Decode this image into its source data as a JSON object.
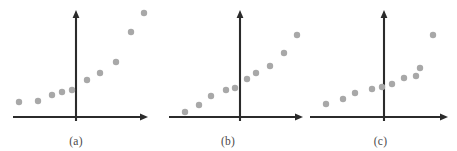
{
  "figure": {
    "width": 457,
    "height": 151,
    "background": "#ffffff",
    "dot_color": "#a8a8a8",
    "axis_color": "#2b2b2b",
    "caption_color": "#4a4a4a",
    "dot_radius": 3.2
  },
  "chart_data": [
    {
      "type": "scatter",
      "title": "",
      "caption": "(a)",
      "xlabel": "",
      "ylabel": "",
      "grid": false,
      "legend": "none",
      "axes": {
        "x_axis_y": 117,
        "x_axis_x_start": 13,
        "x_axis_x_end": 148,
        "y_axis_x": 76,
        "y_axis_y_top": 10,
        "y_axis_y_bottom": 121,
        "origin_x": 76,
        "origin_y": 117,
        "xlim": [
          13,
          148
        ],
        "ylim": [
          10,
          121
        ]
      },
      "panel_origin_x": 0,
      "panel_width": 152,
      "points": [
        {
          "x": 19,
          "y": 102
        },
        {
          "x": 38,
          "y": 101
        },
        {
          "x": 52,
          "y": 95
        },
        {
          "x": 62,
          "y": 92
        },
        {
          "x": 72,
          "y": 90
        },
        {
          "x": 87,
          "y": 80
        },
        {
          "x": 100,
          "y": 73
        },
        {
          "x": 116,
          "y": 62
        },
        {
          "x": 131,
          "y": 32
        },
        {
          "x": 144,
          "y": 13
        }
      ]
    },
    {
      "type": "scatter",
      "title": "",
      "caption": "(b)",
      "xlabel": "",
      "ylabel": "",
      "grid": false,
      "legend": "none",
      "axes": {
        "x_axis_y": 117,
        "x_axis_x_start": 169,
        "x_axis_x_end": 303,
        "y_axis_x": 240,
        "y_axis_y_top": 10,
        "y_axis_y_bottom": 121,
        "origin_x": 240,
        "origin_y": 117,
        "xlim": [
          169,
          303
        ],
        "ylim": [
          10,
          121
        ]
      },
      "panel_origin_x": 152,
      "panel_width": 152,
      "points": [
        {
          "x": 185,
          "y": 112
        },
        {
          "x": 199,
          "y": 105
        },
        {
          "x": 211,
          "y": 96
        },
        {
          "x": 226,
          "y": 90
        },
        {
          "x": 235,
          "y": 88
        },
        {
          "x": 247,
          "y": 79
        },
        {
          "x": 256,
          "y": 73
        },
        {
          "x": 270,
          "y": 66
        },
        {
          "x": 284,
          "y": 53
        },
        {
          "x": 297,
          "y": 35
        }
      ]
    },
    {
      "type": "scatter",
      "title": "",
      "caption": "(c)",
      "xlabel": "",
      "ylabel": "",
      "grid": false,
      "legend": "none",
      "axes": {
        "x_axis_y": 117,
        "x_axis_x_start": 310,
        "x_axis_x_end": 448,
        "y_axis_x": 384,
        "y_axis_y_top": 10,
        "y_axis_y_bottom": 121,
        "origin_x": 384,
        "origin_y": 117,
        "xlim": [
          310,
          448
        ],
        "ylim": [
          10,
          121
        ]
      },
      "panel_origin_x": 304,
      "panel_width": 153,
      "points": [
        {
          "x": 326,
          "y": 104
        },
        {
          "x": 343,
          "y": 99
        },
        {
          "x": 355,
          "y": 93
        },
        {
          "x": 372,
          "y": 89
        },
        {
          "x": 382,
          "y": 87
        },
        {
          "x": 392,
          "y": 84
        },
        {
          "x": 404,
          "y": 78
        },
        {
          "x": 416,
          "y": 76
        },
        {
          "x": 420,
          "y": 68
        },
        {
          "x": 433,
          "y": 35
        }
      ]
    }
  ]
}
